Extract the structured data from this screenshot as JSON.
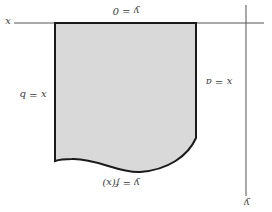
{
  "diagram": {
    "orientation": "rotated 180 degrees",
    "axes": {
      "x_axis_label": "x",
      "y_axis_label": "y",
      "axis_color": "#555555"
    },
    "region": {
      "fill_color": "#d9d9d9",
      "stroke_color": "#1a1a1a",
      "boundaries": {
        "top": "y = 0",
        "left": "x = b",
        "right": "x = a",
        "bottom": "y = f(x)"
      }
    }
  }
}
